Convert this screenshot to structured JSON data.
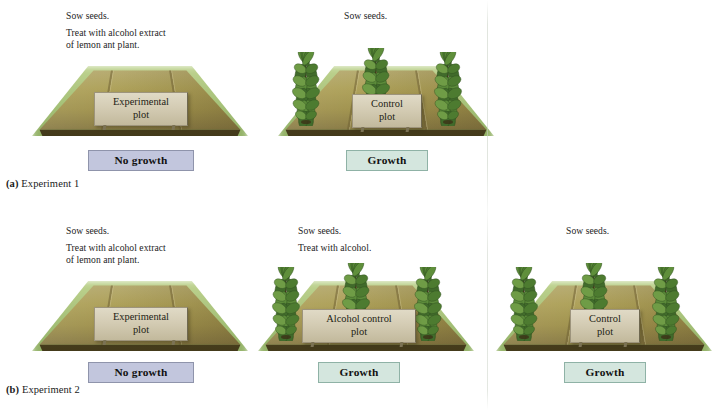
{
  "figure": {
    "type": "science-diagram"
  },
  "colors": {
    "no_growth_fill": "#c2c6dd",
    "no_growth_border": "#8f94ab",
    "growth_fill": "#d4e6de",
    "growth_border": "#8fb2a6",
    "soil": "#a89a5e",
    "grass": "#9dbb6c",
    "plaque": "#d4ccb4",
    "leaf": "#4e7a33"
  },
  "experiments": [
    {
      "id": "experiment-1",
      "caption_marker": "(a)",
      "caption_text": "Experiment 1",
      "plots": [
        {
          "id": "experimental-plot-1",
          "instructions": [
            "Sow seeds.",
            "Treat with alcohol extract",
            "of lemon ant plant."
          ],
          "sign_line1": "Experimental",
          "sign_line2": "plot",
          "result": "No growth",
          "result_kind": "no-growth",
          "plant_count": 0
        },
        {
          "id": "control-plot-1",
          "instructions": [
            "Sow seeds."
          ],
          "sign_line1": "Control",
          "sign_line2": "plot",
          "result": "Growth",
          "result_kind": "growth",
          "plant_count": 3
        }
      ]
    },
    {
      "id": "experiment-2",
      "caption_marker": "(b)",
      "caption_text": "Experiment 2",
      "plots": [
        {
          "id": "experimental-plot-2",
          "instructions": [
            "Sow seeds.",
            "Treat with alcohol extract",
            "of lemon ant plant."
          ],
          "sign_line1": "Experimental",
          "sign_line2": "plot",
          "result": "No growth",
          "result_kind": "no-growth",
          "plant_count": 0
        },
        {
          "id": "alcohol-control-plot-2",
          "instructions": [
            "Sow seeds.",
            "Treat with alcohol."
          ],
          "sign_line1": "Alcohol control",
          "sign_line2": "plot",
          "result": "Growth",
          "result_kind": "growth",
          "plant_count": 3
        },
        {
          "id": "control-plot-2",
          "instructions": [
            "Sow seeds."
          ],
          "sign_line1": "Control",
          "sign_line2": "plot",
          "result": "Growth",
          "result_kind": "growth",
          "plant_count": 3
        }
      ]
    }
  ]
}
